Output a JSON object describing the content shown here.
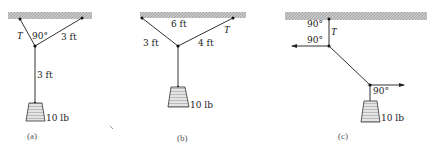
{
  "figure": {
    "colors": {
      "ceiling_fill": "#bdbdbd",
      "rope": "#333333",
      "weight_fill": "#d8d8d8",
      "text": "#222222"
    },
    "panels": [
      {
        "id": "a",
        "caption": "(a)",
        "labels": {
          "tension": "T",
          "angle": "90°",
          "right_rope_length": "3 ft",
          "vertical_rope_length": "3 ft",
          "weight": "10 lb"
        }
      },
      {
        "id": "b",
        "caption": "(b)",
        "labels": {
          "span": "6 ft",
          "left_rope_length": "3 ft",
          "right_rope_length": "4 ft",
          "tension": "T",
          "weight": "10 lb"
        }
      },
      {
        "id": "c",
        "caption": "(c)",
        "labels": {
          "top_angle": "90°",
          "tension": "T",
          "middle_angle": "90°",
          "bottom_angle": "90°",
          "weight": "10 lb"
        }
      }
    ]
  }
}
